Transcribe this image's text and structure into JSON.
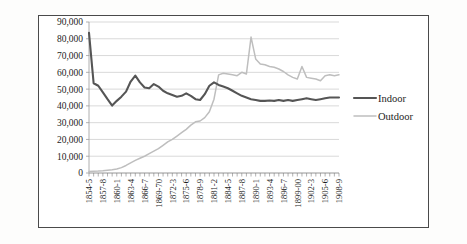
{
  "chart_data": {
    "type": "line",
    "title": "",
    "subtitle": "",
    "xlabel": "",
    "ylabel": "",
    "ylim": [
      0,
      90000
    ],
    "ytick_step": 10000,
    "ytick_labels": [
      "0",
      "10,000",
      "20,000",
      "30,000",
      "40,000",
      "50,000",
      "60,000",
      "70,000",
      "80,000",
      "90,000"
    ],
    "ytick_values": [
      0,
      10000,
      20000,
      30000,
      40000,
      50000,
      60000,
      70000,
      80000,
      90000
    ],
    "grid": true,
    "legend_position": "right",
    "legend": [
      "Indoor",
      "Outdoor"
    ],
    "colors": {
      "indoor": "#555555",
      "outdoor": "#bebebe",
      "grid": "#c9c9c9",
      "axis": "#9b9b9b"
    },
    "x_tick_labels_every": 3,
    "categories": [
      "1854-5",
      "1855-6",
      "1856-7",
      "1857-8",
      "1858-9",
      "1859-60",
      "1860-1",
      "1861-2",
      "1862-3",
      "1863-4",
      "1864-5",
      "1865-6",
      "1866-7",
      "1867-8",
      "1868-9",
      "1869-70",
      "1870-1",
      "1871-2",
      "1872-3",
      "1873-4",
      "1874-5",
      "1875-6",
      "1876-7",
      "1877-8",
      "1878-9",
      "1879-80",
      "1880-1",
      "1881-2",
      "1882-3",
      "1883-4",
      "1884-5",
      "1885-6",
      "1886-7",
      "1887-8",
      "1888-9",
      "1889-90",
      "1890-1",
      "1891-2",
      "1892-3",
      "1893-4",
      "1894-5",
      "1895-6",
      "1896-7",
      "1897-8",
      "1898-9",
      "1899-00",
      "1900-1",
      "1901-2",
      "1902-3",
      "1903-4",
      "1904-5",
      "1905-6",
      "1906-7",
      "1907-8",
      "1908-9"
    ],
    "labelled_categories": [
      "1854-5",
      "1857-8",
      "1860-1",
      "1863-4",
      "1866-7",
      "1869-70",
      "1872-3",
      "1875-6",
      "1878-9",
      "1881-2",
      "1884-5",
      "1887-8",
      "1890-1",
      "1893-4",
      "1896-7",
      "1899-00",
      "1902-3",
      "1905-6",
      "1908-9"
    ],
    "series": [
      {
        "name": "Indoor",
        "values": [
          83500,
          53500,
          52000,
          48000,
          44000,
          40200,
          43000,
          45500,
          48500,
          54500,
          58000,
          54000,
          51000,
          50500,
          53000,
          51500,
          49000,
          47500,
          46500,
          45500,
          46000,
          47500,
          46000,
          44000,
          43500,
          47000,
          52000,
          54000,
          52500,
          51500,
          50500,
          49000,
          47500,
          46000,
          45000,
          44000,
          43500,
          43000,
          43000,
          43200,
          43000,
          43500,
          43000,
          43500,
          43000,
          43500,
          44000,
          44500,
          44000,
          43500,
          44000,
          44500,
          45000,
          45000,
          45000
        ]
      },
      {
        "name": "Outdoor",
        "values": [
          900,
          1100,
          1200,
          1400,
          1700,
          2000,
          2400,
          3200,
          4500,
          6000,
          7500,
          8800,
          10000,
          11500,
          13000,
          14500,
          16500,
          18500,
          20000,
          22000,
          24000,
          26000,
          28500,
          30500,
          31000,
          33000,
          36500,
          44000,
          58500,
          59500,
          59000,
          58500,
          58000,
          60000,
          59000,
          81000,
          68000,
          65000,
          64500,
          63500,
          63000,
          62000,
          60500,
          58500,
          57000,
          56000,
          63500,
          57000,
          56500,
          56000,
          55000,
          58000,
          58500,
          58000,
          58500
        ]
      }
    ]
  }
}
